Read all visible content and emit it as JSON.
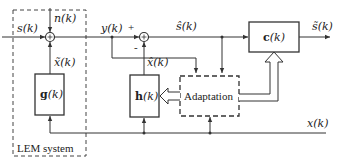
{
  "diagram": {
    "type": "block-diagram",
    "title": "",
    "lem_system": {
      "label": "LEM system"
    },
    "signals": {
      "input": "s(k)",
      "noise": "n(k)",
      "echo": "x̃(k)",
      "mic": "y(k)",
      "plus": "+",
      "minus": "-",
      "echo_estimate": "x̂(k)",
      "error": "ŝ(k)",
      "output": "s̃(k)",
      "reference": "x(k)"
    },
    "blocks": {
      "g": {
        "bold": "g",
        "arg": "(k)"
      },
      "h": {
        "bold": "h",
        "arg": "(k)"
      },
      "c": {
        "bold": "c",
        "arg": "(k)"
      },
      "adaptation": "Adaptation"
    },
    "colors": {
      "line": "#333333",
      "background": "#ffffff"
    }
  }
}
